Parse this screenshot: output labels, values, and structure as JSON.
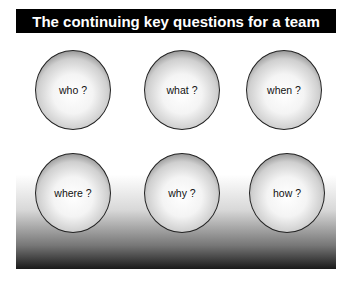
{
  "title": "The continuing key questions for a team",
  "questions": [
    {
      "label": "who ?"
    },
    {
      "label": "what ?"
    },
    {
      "label": "when ?"
    },
    {
      "label": "where ?"
    },
    {
      "label": "why ?"
    },
    {
      "label": "how ?"
    }
  ],
  "colors": {
    "title_bg": "#000000",
    "title_text": "#ffffff",
    "sphere_border": "#222222"
  }
}
